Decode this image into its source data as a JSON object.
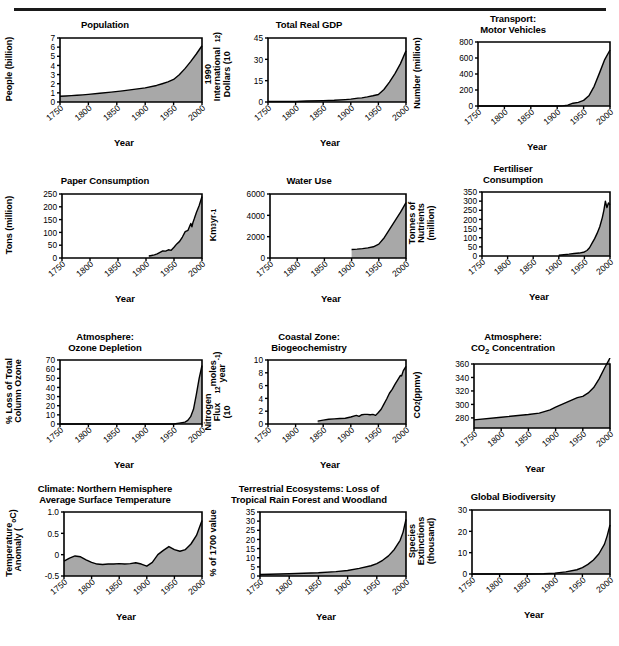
{
  "figure": {
    "title": "",
    "footer_note": "",
    "rule_color": "#1a1a1a",
    "fill_color": "#a8a8a8",
    "line_color": "#000000",
    "axis_color": "#000000",
    "xlabel": "Year",
    "xticks": [
      "1750",
      "1800",
      "1850",
      "1900",
      "1950",
      "2000"
    ],
    "xlim": [
      1750,
      2000
    ]
  },
  "chart_data": [
    {
      "id": "population",
      "type": "area",
      "title": "Population",
      "xlabel": "Year",
      "ylabel": "People (billion)",
      "ylim": [
        0,
        7
      ],
      "yticks": [
        "0",
        "1",
        "2",
        "3",
        "4",
        "5",
        "6",
        "7"
      ],
      "xlim": [
        1750,
        2000
      ],
      "xticks": [
        "1750",
        "1800",
        "1850",
        "1900",
        "1950",
        "2000"
      ],
      "grid": false,
      "x": [
        1750,
        1760,
        1770,
        1780,
        1790,
        1800,
        1820,
        1840,
        1860,
        1880,
        1900,
        1920,
        1930,
        1940,
        1950,
        1960,
        1970,
        1980,
        1990,
        2000
      ],
      "values": [
        0.63,
        0.66,
        0.7,
        0.74,
        0.78,
        0.83,
        0.95,
        1.08,
        1.22,
        1.38,
        1.55,
        1.81,
        2.0,
        2.2,
        2.47,
        2.98,
        3.65,
        4.42,
        5.25,
        6.15
      ]
    },
    {
      "id": "gdp",
      "type": "area",
      "title": "Total Real GDP",
      "xlabel": "Year",
      "ylabel": "1990 International Dollars (10^12)",
      "ylabel_parts": [
        "1990 International",
        "Dollars (10",
        "12",
        ")"
      ],
      "ylim": [
        0,
        45
      ],
      "yticks": [
        "0",
        "15",
        "30",
        "45"
      ],
      "xlim": [
        1750,
        2000
      ],
      "xticks": [
        "1750",
        "1800",
        "1850",
        "1900",
        "1950",
        "2000"
      ],
      "grid": false,
      "x": [
        1750,
        1800,
        1820,
        1850,
        1870,
        1890,
        1900,
        1913,
        1920,
        1930,
        1940,
        1950,
        1960,
        1970,
        1980,
        1990,
        2000
      ],
      "values": [
        0.3,
        0.4,
        0.7,
        1.0,
        1.2,
        1.7,
        2.0,
        2.7,
        2.9,
        3.6,
        4.4,
        5.3,
        8.8,
        14.0,
        20.0,
        27.0,
        36.0
      ]
    },
    {
      "id": "motor-vehicles",
      "type": "area",
      "title": "Transport:\nMotor Vehicles",
      "xlabel": "Year",
      "ylabel": "Number (million)",
      "ylim": [
        0,
        800
      ],
      "yticks": [
        "0",
        "200",
        "400",
        "600",
        "800"
      ],
      "xlim": [
        1750,
        2000
      ],
      "xticks": [
        "1750",
        "1800",
        "1850",
        "1900",
        "1950",
        "2000"
      ],
      "grid": false,
      "x": [
        1750,
        1850,
        1900,
        1910,
        1920,
        1930,
        1940,
        1950,
        1960,
        1970,
        1980,
        1990,
        2000
      ],
      "values": [
        0,
        0,
        0,
        1,
        10,
        35,
        46,
        70,
        127,
        246,
        411,
        580,
        700
      ]
    },
    {
      "id": "paper-consumption",
      "type": "area",
      "title": "Paper Consumption",
      "xlabel": "Year",
      "ylabel": "Tons (million)",
      "ylim": [
        0,
        250
      ],
      "yticks": [
        "0",
        "50",
        "100",
        "150",
        "200",
        "250"
      ],
      "xlim": [
        1750,
        2000
      ],
      "xticks": [
        "1750",
        "1800",
        "1850",
        "1900",
        "1950",
        "2000"
      ],
      "grid": false,
      "x": [
        1905,
        1910,
        1915,
        1920,
        1925,
        1930,
        1935,
        1940,
        1945,
        1950,
        1955,
        1960,
        1965,
        1970,
        1975,
        1980,
        1982,
        1984,
        1986,
        1990,
        1995,
        2000
      ],
      "values": [
        8,
        10,
        12,
        16,
        22,
        28,
        27,
        32,
        30,
        42,
        55,
        65,
        82,
        103,
        108,
        135,
        122,
        140,
        152,
        178,
        205,
        240
      ]
    },
    {
      "id": "water-use",
      "type": "area",
      "title": "Water Use",
      "xlabel": "Year",
      "ylabel": "Km^3 yr^-1",
      "ylim": [
        0,
        6000
      ],
      "yticks": [
        "0",
        "2000",
        "4000",
        "6000"
      ],
      "xlim": [
        1750,
        2000
      ],
      "xticks": [
        "1750",
        "1800",
        "1850",
        "1900",
        "1950",
        "2000"
      ],
      "grid": false,
      "x": [
        1900,
        1910,
        1920,
        1930,
        1940,
        1950,
        1960,
        1970,
        1980,
        1990,
        2000
      ],
      "values": [
        800,
        830,
        880,
        950,
        1050,
        1300,
        1900,
        2700,
        3500,
        4300,
        5200
      ]
    },
    {
      "id": "fertiliser-consumption",
      "type": "area",
      "title": "Fertiliser\nConsumption",
      "xlabel": "Year",
      "ylabel": "Tonnes of Nutrients (million)",
      "ylabel_parts": [
        "Tonnes of Nutrients",
        "(million)"
      ],
      "ylim": [
        0,
        350
      ],
      "yticks": [
        "0",
        "50",
        "100",
        "150",
        "200",
        "250",
        "300",
        "350"
      ],
      "xlim": [
        1750,
        2000
      ],
      "xticks": [
        "1750",
        "1800",
        "1850",
        "1900",
        "1950",
        "2000"
      ],
      "grid": false,
      "x": [
        1900,
        1910,
        1920,
        1930,
        1940,
        1950,
        1955,
        1960,
        1965,
        1970,
        1975,
        1980,
        1985,
        1988,
        1991,
        1994,
        1997,
        2000
      ],
      "values": [
        4,
        7,
        10,
        14,
        16,
        22,
        30,
        45,
        70,
        95,
        125,
        160,
        210,
        250,
        300,
        265,
        290,
        280
      ]
    },
    {
      "id": "ozone-depletion",
      "type": "area",
      "title": "Atmosphere:\nOzone Depletion",
      "xlabel": "Year",
      "ylabel": "% Loss of Total Column Ozone",
      "ylabel_parts": [
        "% Loss of Total",
        "Column Ozone"
      ],
      "ylim": [
        0,
        70
      ],
      "yticks": [
        "0",
        "10",
        "20",
        "30",
        "40",
        "50",
        "60",
        "70"
      ],
      "xlim": [
        1750,
        2000
      ],
      "xticks": [
        "1750",
        "1800",
        "1850",
        "1900",
        "1950",
        "2000"
      ],
      "grid": false,
      "x": [
        1750,
        1950,
        1960,
        1970,
        1975,
        1980,
        1985,
        1990,
        1995,
        2000
      ],
      "values": [
        0,
        0,
        1,
        2,
        4,
        8,
        16,
        32,
        50,
        64
      ]
    },
    {
      "id": "coastal-nitrogen",
      "type": "area",
      "title": "Coastal Zone:\nBiogeochemistry",
      "xlabel": "Year",
      "ylabel": "Nitrogen Flux (10^12 moles year^-1)",
      "ylabel_parts": [
        "Nitrogen Flux",
        "(10",
        "12",
        " moles year",
        "-1",
        ")"
      ],
      "ylim": [
        0,
        10
      ],
      "yticks": [
        "0",
        "2",
        "4",
        "6",
        "8",
        "10"
      ],
      "xlim": [
        1750,
        2000
      ],
      "xticks": [
        "1750",
        "1800",
        "1850",
        "1900",
        "1950",
        "2000"
      ],
      "grid": false,
      "x": [
        1840,
        1850,
        1860,
        1870,
        1880,
        1890,
        1900,
        1910,
        1915,
        1920,
        1925,
        1930,
        1935,
        1940,
        1945,
        1950,
        1955,
        1960,
        1965,
        1970,
        1975,
        1980,
        1985,
        1990,
        1992,
        1995,
        2000
      ],
      "values": [
        0.45,
        0.6,
        0.75,
        0.8,
        0.85,
        0.9,
        1.1,
        1.35,
        1.2,
        1.45,
        1.5,
        1.5,
        1.45,
        1.5,
        1.35,
        1.8,
        2.3,
        3.1,
        3.9,
        4.8,
        5.4,
        6.2,
        6.9,
        7.6,
        7.5,
        8.3,
        9.0
      ]
    },
    {
      "id": "co2-concentration",
      "type": "area",
      "title": "Atmosphere:\nCO2 Concentration",
      "title_parts": [
        "Atmosphere:",
        "CO",
        "2",
        " Concentration"
      ],
      "xlabel": "Year",
      "ylabel": "CO2 (ppmv)",
      "ylabel_parts": [
        "CO",
        "2",
        " (ppmv)"
      ],
      "ylim": [
        265,
        360
      ],
      "yticks": [
        "280",
        "300",
        "320",
        "340",
        "360"
      ],
      "xlim": [
        1750,
        2000
      ],
      "xticks": [
        "1750",
        "1800",
        "1850",
        "1900",
        "1950",
        "2000"
      ],
      "grid": false,
      "x": [
        1750,
        1800,
        1850,
        1870,
        1890,
        1900,
        1920,
        1940,
        1950,
        1960,
        1970,
        1980,
        1990,
        2000
      ],
      "values": [
        277,
        281,
        285,
        287,
        292,
        296,
        303,
        310,
        312,
        317,
        325,
        338,
        354,
        369
      ]
    },
    {
      "id": "temperature-anomaly",
      "type": "area",
      "title": "Climate: Northern Hemisphere\nAverage Surface Temperature",
      "xlabel": "Year",
      "ylabel": "Temperature Anomaly (°C)",
      "ylabel_parts": [
        "Temperature",
        "Anomaly (°C)"
      ],
      "ylim": [
        -0.5,
        1.0
      ],
      "yticks": [
        "-0.5",
        "0",
        "0.5",
        "1.0"
      ],
      "xlim": [
        1750,
        2000
      ],
      "xticks": [
        "1750",
        "1800",
        "1850",
        "1900",
        "1950",
        "2000"
      ],
      "grid": false,
      "x": [
        1750,
        1760,
        1770,
        1780,
        1790,
        1800,
        1810,
        1820,
        1830,
        1840,
        1850,
        1860,
        1870,
        1880,
        1890,
        1900,
        1910,
        1920,
        1930,
        1940,
        1950,
        1960,
        1970,
        1980,
        1990,
        2000
      ],
      "values": [
        -0.15,
        -0.08,
        -0.03,
        -0.05,
        -0.12,
        -0.18,
        -0.22,
        -0.23,
        -0.22,
        -0.22,
        -0.21,
        -0.22,
        -0.21,
        -0.19,
        -0.22,
        -0.27,
        -0.18,
        0.0,
        0.1,
        0.19,
        0.12,
        0.08,
        0.12,
        0.25,
        0.45,
        0.8
      ]
    },
    {
      "id": "forest-loss",
      "type": "area",
      "title": "Terrestrial Ecosystems: Loss of\nTropical Rain Forest and Woodland",
      "xlabel": "Year",
      "ylabel": "% of 1700 value",
      "ylim": [
        0,
        35
      ],
      "yticks": [
        "0",
        "5",
        "10",
        "15",
        "20",
        "25",
        "30",
        "35"
      ],
      "xlim": [
        1750,
        2000
      ],
      "xticks": [
        "1750",
        "1800",
        "1850",
        "1900",
        "1950",
        "2000"
      ],
      "grid": false,
      "x": [
        1750,
        1800,
        1850,
        1880,
        1900,
        1920,
        1940,
        1950,
        1960,
        1970,
        1980,
        1990,
        1995,
        2000
      ],
      "values": [
        0.8,
        1.2,
        1.8,
        2.4,
        3.0,
        4.2,
        5.6,
        6.8,
        8.6,
        11.0,
        14.5,
        19.5,
        24.0,
        31.0
      ]
    },
    {
      "id": "global-biodiversity",
      "type": "area",
      "title": "Global Biodiversity",
      "xlabel": "Year",
      "ylabel": "Species Extinctions (thousand)",
      "ylabel_parts": [
        "Species Extinctions",
        "(thousand)"
      ],
      "ylim": [
        0,
        30
      ],
      "yticks": [
        "0",
        "10",
        "20",
        "30"
      ],
      "xlim": [
        1750,
        2000
      ],
      "xticks": [
        "1750",
        "1800",
        "1850",
        "1900",
        "1950",
        "2000"
      ],
      "grid": false,
      "x": [
        1750,
        1850,
        1880,
        1900,
        1920,
        1940,
        1950,
        1960,
        1970,
        1980,
        1990,
        1995,
        2000
      ],
      "values": [
        0,
        0,
        0.1,
        0.4,
        1.0,
        2.0,
        3.0,
        4.5,
        6.6,
        9.5,
        14.0,
        18.0,
        23.0
      ]
    }
  ]
}
